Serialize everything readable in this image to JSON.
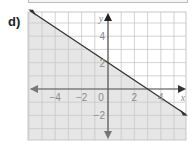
{
  "problem_label": "d)",
  "chart_data": {
    "type": "line",
    "title": "",
    "xlabel": "x",
    "ylabel": "y",
    "xlim": [
      -6,
      6
    ],
    "ylim": [
      -4,
      6
    ],
    "grid": true,
    "x_ticks": [
      -4,
      -2,
      0,
      2,
      4
    ],
    "y_ticks": [
      4,
      2,
      -2
    ],
    "x_tick_labels": [
      "−4",
      "−2",
      "0",
      "2",
      "4"
    ],
    "y_tick_labels": [
      "4",
      "2",
      "−2"
    ],
    "series": [
      {
        "name": "boundary line",
        "equation": "y = -2/3 x + 2",
        "style": "solid",
        "points": [
          [
            -6,
            6
          ],
          [
            0,
            2
          ],
          [
            3,
            0
          ],
          [
            6,
            -2
          ]
        ]
      }
    ],
    "shaded_region": "below line (y ≤ -2/3x + 2)",
    "colors": {
      "shade": "#e6e6e6",
      "grid": "#c8c8c8",
      "axis": "#555555",
      "line": "#333333"
    }
  }
}
